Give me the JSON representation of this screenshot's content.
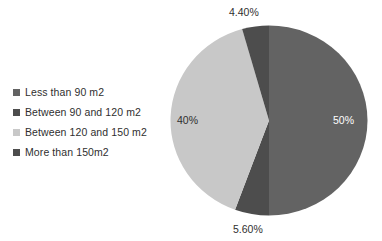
{
  "chart_data": {
    "type": "pie",
    "title": "",
    "subtitle": "",
    "xlabel": "",
    "ylabel": "",
    "grid": false,
    "legend_position": "left",
    "start_angle_deg": 0,
    "direction": "clockwise",
    "categories": [
      "Less than 90 m2",
      "Between 90 and 120 m2",
      "Between 120 and 150 m2",
      "More than 150m2"
    ],
    "values": [
      50,
      5.6,
      40,
      4.4
    ],
    "value_labels": [
      "50%",
      "5.60%",
      "40%",
      "4.40%"
    ],
    "colors": [
      "#636363",
      "#4d4d4d",
      "#c8c8c8",
      "#4d4d4d"
    ],
    "slices": [
      {
        "name": "Less than 90 m2",
        "value": 50,
        "label": "50%",
        "color": "#636363",
        "label_color": "#ffffff",
        "start_deg": 0,
        "end_deg": 180
      },
      {
        "name": "Between 90 and 120 m2",
        "value": 5.6,
        "label": "5.60%",
        "color": "#4d4d4d",
        "label_color": "#2f2f2f",
        "start_deg": 180,
        "end_deg": 200.16
      },
      {
        "name": "Between 120 and 150 m2",
        "value": 40,
        "label": "40%",
        "color": "#c8c8c8",
        "label_color": "#2f2f2f",
        "start_deg": 200.16,
        "end_deg": 344.16
      },
      {
        "name": "More than 150m2",
        "value": 4.4,
        "label": "4.40%",
        "color": "#4d4d4d",
        "label_color": "#2f2f2f",
        "start_deg": 344.16,
        "end_deg": 360
      }
    ]
  },
  "legend": {
    "items": [
      {
        "label": "Less than 90 m2",
        "color": "#636363"
      },
      {
        "label": "Between 90 and 120 m2",
        "color": "#4d4d4d"
      },
      {
        "label": "Between 120 and 150 m2",
        "color": "#c8c8c8"
      },
      {
        "label": "More than 150m2",
        "color": "#4d4d4d"
      }
    ]
  },
  "labels": {
    "top": "4.40%",
    "right": "50%",
    "left": "40%",
    "bottom": "5.60%"
  },
  "colors": {
    "background": "#ffffff",
    "text": "#2f2f2f",
    "slice_large": "#636363",
    "slice_light": "#c8c8c8",
    "slice_dark": "#4d4d4d"
  }
}
